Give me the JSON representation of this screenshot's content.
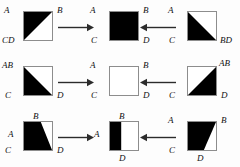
{
  "diagram": {
    "background_color": "#fdfdfd",
    "fill_color": "#000000",
    "outline_color": "#8d8d8d",
    "text_color": "#111111",
    "rows": [
      {
        "row_label": "row-1",
        "left": {
          "shape_name": "upper-left-triangle-filled-square",
          "fill": "upper-left-triangle",
          "labels": {
            "tl": "A",
            "tr": "B",
            "bl": "CD",
            "br": "",
            "tc": "",
            "bc": ""
          }
        },
        "arrow_left": {
          "direction": "right",
          "name": "arrow-right"
        },
        "middle": {
          "shape_name": "fully-filled-square",
          "fill": "full",
          "labels": {
            "tl": "A",
            "tr": "B",
            "bl": "C",
            "br": "D",
            "tc": "",
            "bc": ""
          }
        },
        "arrow_right": {
          "direction": "left",
          "name": "arrow-left"
        },
        "right": {
          "shape_name": "lower-left-triangle-filled-square",
          "fill": "lower-left-triangle",
          "labels": {
            "tl": "A",
            "tr": "",
            "bl": "C",
            "br": "BD",
            "tc": "",
            "bc": ""
          }
        }
      },
      {
        "row_label": "row-2",
        "left": {
          "shape_name": "lower-left-triangle-filled-square",
          "fill": "lower-left-triangle",
          "labels": {
            "tl": "AB",
            "tr": "",
            "bl": "C",
            "br": "D",
            "tc": "",
            "bc": ""
          }
        },
        "arrow_left": {
          "direction": "right",
          "name": "arrow-right"
        },
        "middle": {
          "shape_name": "empty-square",
          "fill": "none",
          "labels": {
            "tl": "A",
            "tr": "B",
            "bl": "C",
            "br": "D",
            "tc": "",
            "bc": ""
          }
        },
        "arrow_right": {
          "direction": "left",
          "name": "arrow-left"
        },
        "right": {
          "shape_name": "lower-right-triangle-filled-square",
          "fill": "lower-right-triangle",
          "labels": {
            "tl": "",
            "tr": "AB",
            "bl": "C",
            "br": "D",
            "tc": "",
            "bc": ""
          }
        }
      },
      {
        "row_label": "row-3",
        "left": {
          "shape_name": "left-trapezoid-filled-square",
          "fill": "trapezoid-top-partial-to-bottom-right",
          "labels": {
            "tl": "",
            "tr": "",
            "bl": "C",
            "br": "D",
            "tc": "B",
            "bc": "",
            "ml": "A"
          }
        },
        "arrow_left": {
          "direction": "right",
          "name": "arrow-right"
        },
        "middle": {
          "shape_name": "left-strip-filled-square",
          "fill": "left-vertical-strip",
          "labels": {
            "tl": "",
            "tr": "",
            "bl": "",
            "br": "",
            "tc": "B",
            "bc": "D",
            "ml": "A",
            "mr": ""
          }
        },
        "arrow_right": {
          "direction": "left",
          "name": "arrow-left"
        },
        "right": {
          "shape_name": "top-trapezoid-filled-square",
          "fill": "trapezoid-full-top-to-bottom-partial",
          "labels": {
            "tl": "A",
            "tr": "B",
            "bl": "C",
            "br": "",
            "tc": "",
            "bc": "D"
          }
        }
      }
    ]
  }
}
